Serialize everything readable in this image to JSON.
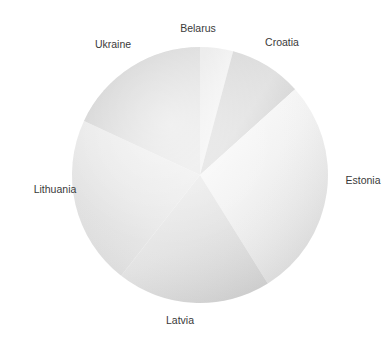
{
  "chart_title": "",
  "chart_data": {
    "type": "pie",
    "title": "",
    "subtitle": "",
    "xlabel": "",
    "ylabel": "",
    "legend_position": "none",
    "labels_position": "outside",
    "grid": false,
    "start_angle_deg": 0,
    "direction": "clockwise",
    "center": {
      "cx": 200,
      "cy": 175
    },
    "radius": 128,
    "categories": [
      "Belarus",
      "Croatia",
      "Estonia",
      "Latvia",
      "Lithuania",
      "Ukraine"
    ],
    "values": [
      4.2,
      9.2,
      27.8,
      19.4,
      21.4,
      18.0
    ],
    "units": "percent",
    "slices": [
      {
        "label": "Belarus",
        "value": 4.2,
        "start_deg": 0,
        "end_deg": 15,
        "fill_light": "#f4f4f4",
        "fill_dark": "#d9d9d9"
      },
      {
        "label": "Croatia",
        "value": 9.2,
        "start_deg": 15,
        "end_deg": 48,
        "fill_light": "#e2e2e2",
        "fill_dark": "#c8c8c8"
      },
      {
        "label": "Estonia",
        "value": 27.8,
        "start_deg": 48,
        "end_deg": 148,
        "fill_light": "#fbfbfb",
        "fill_dark": "#e0e0e0"
      },
      {
        "label": "Latvia",
        "value": 19.4,
        "start_deg": 148,
        "end_deg": 218,
        "fill_light": "#e9e9e9",
        "fill_dark": "#cfcfcf"
      },
      {
        "label": "Lithuania",
        "value": 21.4,
        "start_deg": 218,
        "end_deg": 295,
        "fill_light": "#f0f0f0",
        "fill_dark": "#dcdcdc"
      },
      {
        "label": "Ukraine",
        "value": 18.0,
        "start_deg": 295,
        "end_deg": 360,
        "fill_light": "#e6e6e6",
        "fill_dark": "#c6c6c6"
      }
    ]
  },
  "labels": {
    "belarus": "Belarus",
    "croatia": "Croatia",
    "estonia": "Estonia",
    "latvia": "Latvia",
    "lithuania": "Lithuania",
    "ukraine": "Ukraine"
  },
  "colors": {
    "background": "#ffffff",
    "label_text": "#3a3a3a",
    "pie_light": "#fbfbfb",
    "pie_mid": "#e4e4e4",
    "pie_dark": "#c6c6c6"
  }
}
